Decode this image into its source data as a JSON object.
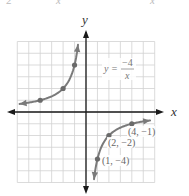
{
  "top_fragments": {
    "left": "2",
    "mid": "x",
    "right": "x"
  },
  "axes": {
    "x_label": "x",
    "y_label": "y"
  },
  "equation": {
    "lhs": "y =",
    "numerator": "−4",
    "denominator": "x"
  },
  "point_labels": [
    "(4, −1)",
    "(2, −2)",
    "(1, −4)"
  ],
  "colors": {
    "grid": "#cfcfcf",
    "axis": "#1a1a1a",
    "curve": "#7a7a7a",
    "point": "#6e6e6e",
    "label": "#666666"
  },
  "chart_data": {
    "type": "line",
    "xlabel": "x",
    "ylabel": "y",
    "xlim": [
      -6,
      6
    ],
    "ylim": [
      -6,
      6
    ],
    "grid": true,
    "legend": null,
    "series": [
      {
        "name": "y = -4/x (x<0 branch)",
        "x": [
          -5.8,
          -4,
          -2,
          -1,
          -0.7
        ],
        "values": [
          0.69,
          1,
          2,
          4,
          5.7
        ],
        "marked_points": [
          [
            -4,
            1
          ],
          [
            -2,
            2
          ],
          [
            -1,
            4
          ]
        ]
      },
      {
        "name": "y = -4/x (x>0 branch)",
        "x": [
          0.7,
          1,
          2,
          4,
          5.6
        ],
        "values": [
          -5.7,
          -4,
          -2,
          -1,
          -0.71
        ],
        "marked_points": [
          [
            1,
            -4
          ],
          [
            2,
            -2
          ],
          [
            4,
            -1
          ]
        ]
      }
    ],
    "annotations": [
      {
        "text": "y = -4/x",
        "at": [
          3.5,
          3.5
        ]
      },
      {
        "text": "(4, -1)",
        "at": [
          4,
          -1
        ]
      },
      {
        "text": "(2, -2)",
        "at": [
          2,
          -2
        ]
      },
      {
        "text": "(1, -4)",
        "at": [
          1,
          -4
        ]
      }
    ]
  }
}
